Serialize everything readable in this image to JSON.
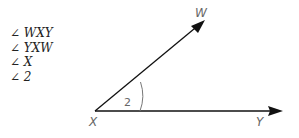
{
  "angle_names": [
    "∠ WXY",
    "∠ YXW",
    "∠ X",
    "∠ 2"
  ],
  "diagram": {
    "vertex_label": "X",
    "ray1_label": "W",
    "ray2_label": "Y",
    "angle_number": "2"
  }
}
